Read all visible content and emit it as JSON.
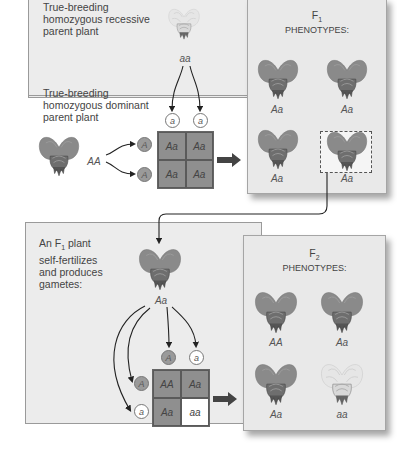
{
  "top_panel": {
    "recessive_label": "True-breeding homozygous recessive parent plant",
    "recessive_label_lines": [
      "True-breeding",
      "homozygous recessive",
      "parent plant"
    ],
    "recessive_genotype": "aa",
    "dominant_label_lines": [
      "True-breeding",
      "homozygous dominant",
      "parent plant"
    ],
    "dominant_genotype": "AA",
    "gametes_top": [
      "a",
      "a"
    ],
    "gametes_left": [
      "A",
      "A"
    ],
    "punnett": [
      [
        "Aa",
        "Aa"
      ],
      [
        "Aa",
        "Aa"
      ]
    ]
  },
  "f1_panel": {
    "title_generation": "F",
    "title_subscript": "1",
    "title_text": "PHENOTYPES:",
    "offspring": [
      "Aa",
      "Aa",
      "Aa",
      "Aa"
    ],
    "selected_index": 3
  },
  "bottom_panel": {
    "label_lines": [
      "An F",
      "1",
      " plant",
      "self-fertilizes",
      "and produces",
      "gametes:"
    ],
    "label_line1_pre": "An F",
    "label_line1_sub": "1",
    "label_line1_post": " plant",
    "label_line2": "self-fertilizes",
    "label_line3": "and produces",
    "label_line4": "gametes:",
    "parent_genotype": "Aa",
    "gametes_top": [
      "A",
      "a"
    ],
    "gametes_left": [
      "A",
      "a"
    ],
    "punnett": [
      [
        "AA",
        "Aa"
      ],
      [
        "Aa",
        "aa"
      ]
    ]
  },
  "f2_panel": {
    "title_generation": "F",
    "title_subscript": "2",
    "title_text": "PHENOTYPES:",
    "offspring": [
      "AA",
      "Aa",
      "Aa",
      "aa"
    ]
  },
  "colors": {
    "panel_bg": "#ececec",
    "dominant_flower": "#8c8c8c",
    "recessive_flower": "#e0e0e0",
    "punnett_dominant": "#8f8f8f",
    "punnett_recessive": "#ffffff"
  }
}
